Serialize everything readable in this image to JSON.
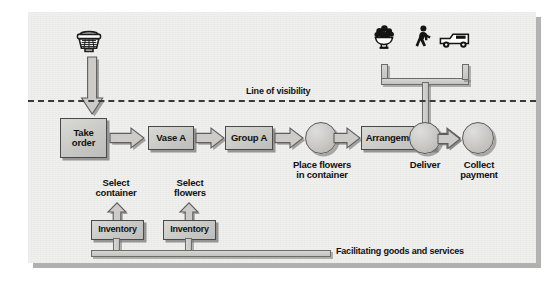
{
  "diagram": {
    "line_of_visibility_label": "Line of visibility",
    "facilitating_label": "Facilitating goods and services",
    "colors": {
      "canvas": "#f0f0ee",
      "box_fill": "#cbcbc7",
      "box_stroke": "#4a4a4a",
      "shadow": "#7a7a78",
      "dashed_line": "#3a3a3a",
      "text": "#111111",
      "icon": "#1a1a1a"
    },
    "above_line_icons": [
      {
        "name": "telephone-icon",
        "label": "telephone"
      },
      {
        "name": "flower-bowl-icon",
        "label": "flower arrangement"
      },
      {
        "name": "walking-person-icon",
        "label": "walk-in customer"
      },
      {
        "name": "delivery-van-icon",
        "label": "delivery van"
      }
    ],
    "process_nodes": [
      {
        "id": "take-order",
        "shape": "box",
        "label": "Take\norder"
      },
      {
        "id": "vase-a",
        "shape": "box",
        "label": "Vase A"
      },
      {
        "id": "group-a",
        "shape": "box",
        "label": "Group A"
      },
      {
        "id": "place-flowers",
        "shape": "circle",
        "label": "Place flowers\nin container"
      },
      {
        "id": "arrangement-a",
        "shape": "box",
        "label": "Arrangement A"
      },
      {
        "id": "deliver",
        "shape": "circle",
        "label": "Deliver"
      },
      {
        "id": "collect-payment",
        "shape": "circle",
        "label": "Collect\npayment"
      }
    ],
    "support_nodes": [
      {
        "id": "inventory-container",
        "label": "Inventory",
        "arrow_label": "Select\ncontainer"
      },
      {
        "id": "inventory-flowers",
        "label": "Inventory",
        "arrow_label": "Select\nflowers"
      }
    ]
  }
}
